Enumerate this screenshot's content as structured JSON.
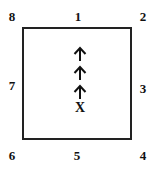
{
  "diagram": {
    "positions": {
      "p1": "1",
      "p2": "2",
      "p3": "3",
      "p4": "4",
      "p5": "5",
      "p6": "6",
      "p7": "7",
      "p8": "8"
    },
    "marker": "X",
    "arrows": [
      {
        "direction": "up",
        "icon": "arrow-up-icon"
      },
      {
        "direction": "up",
        "icon": "arrow-up-icon"
      },
      {
        "direction": "up",
        "icon": "arrow-up-icon"
      }
    ]
  }
}
